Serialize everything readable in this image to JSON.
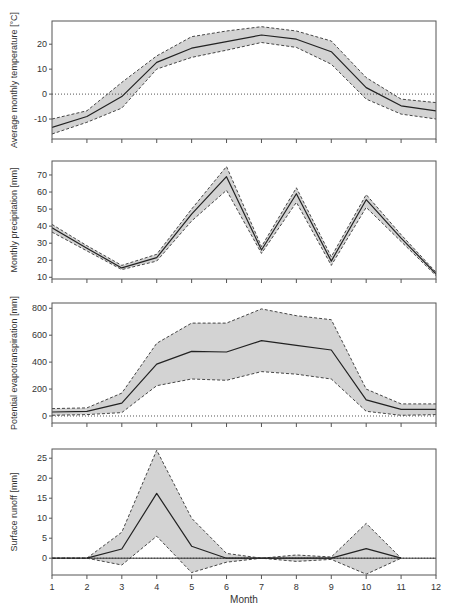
{
  "figure": {
    "x_axis_title": "Month",
    "x_tick_labels": [
      "1",
      "2",
      "3",
      "4",
      "5",
      "6",
      "7",
      "8",
      "9",
      "10",
      "11",
      "12"
    ]
  },
  "colors": {
    "band_fill": "#d3d3d3",
    "mean_line": "#222222",
    "bound_line": "#333333",
    "axis": "#555555",
    "zero_line": "#555555"
  },
  "chart_data": [
    {
      "type": "line",
      "title": "",
      "xlabel": "",
      "ylabel": "Average monthly temperature [°C]",
      "x": [
        1,
        2,
        3,
        4,
        5,
        6,
        7,
        8,
        9,
        10,
        11,
        12
      ],
      "ylim": [
        -18,
        29.3
      ],
      "yticks": [
        -10,
        0,
        10,
        20
      ],
      "ytick_labels": [
        "-10",
        "0",
        "10",
        "20"
      ],
      "zero_line": "dotted",
      "grid": false,
      "series": [
        {
          "name": "mean",
          "style": "solid",
          "values": [
            -13.4,
            -9,
            -1,
            12.7,
            18.4,
            21,
            23.7,
            22,
            17,
            2.6,
            -4.7,
            -6.7
          ]
        },
        {
          "name": "upper bound",
          "style": "dashed",
          "values": [
            -10,
            -6.7,
            4.7,
            15.3,
            23,
            25.3,
            27,
            25.3,
            21.3,
            6.6,
            -2,
            -3.4
          ]
        },
        {
          "name": "lower bound",
          "style": "dashed",
          "values": [
            -16,
            -11.3,
            -5.6,
            10,
            14.7,
            17.6,
            20.7,
            18.7,
            12,
            -2,
            -8,
            -10
          ]
        }
      ]
    },
    {
      "type": "line",
      "title": "",
      "xlabel": "",
      "ylabel": "Monthly precipitation [mm]",
      "x": [
        1,
        2,
        3,
        4,
        5,
        6,
        7,
        8,
        9,
        10,
        11,
        12
      ],
      "ylim": [
        9,
        78.2
      ],
      "yticks": [
        10,
        20,
        30,
        40,
        50,
        60,
        70
      ],
      "ytick_labels": [
        "10",
        "20",
        "30",
        "40",
        "50",
        "60",
        "70"
      ],
      "zero_line": "none",
      "grid": false,
      "series": [
        {
          "name": "mean",
          "style": "solid",
          "values": [
            39,
            27,
            15.5,
            21.5,
            47,
            69,
            26,
            59,
            19.5,
            55.5,
            33,
            12
          ]
        },
        {
          "name": "upper bound",
          "style": "dashed",
          "values": [
            41,
            28.5,
            17,
            23.5,
            50,
            75,
            28,
            62.5,
            22,
            58.5,
            35,
            13
          ]
        },
        {
          "name": "lower bound",
          "style": "dashed",
          "values": [
            36.5,
            25.5,
            14.5,
            19.5,
            43,
            61,
            24,
            54,
            17,
            51,
            31,
            11
          ]
        }
      ]
    },
    {
      "type": "line",
      "title": "",
      "xlabel": "",
      "ylabel": "Potential evapotranspiration [mm]",
      "x": [
        1,
        2,
        3,
        4,
        5,
        6,
        7,
        8,
        9,
        10,
        11,
        12
      ],
      "ylim": [
        -52,
        839
      ],
      "yticks": [
        0,
        200,
        400,
        600,
        800
      ],
      "ytick_labels": [
        "0",
        "200",
        "400",
        "600",
        "800"
      ],
      "zero_line": "dotted",
      "grid": false,
      "series": [
        {
          "name": "mean",
          "style": "solid",
          "values": [
            30,
            35,
            95,
            385,
            480,
            475,
            560,
            525,
            490,
            120,
            50,
            50
          ]
        },
        {
          "name": "upper bound",
          "style": "dashed",
          "values": [
            55,
            60,
            170,
            540,
            690,
            690,
            795,
            745,
            715,
            200,
            90,
            90
          ]
        },
        {
          "name": "lower bound",
          "style": "dashed",
          "values": [
            5,
            10,
            25,
            225,
            275,
            265,
            330,
            310,
            275,
            35,
            5,
            10
          ]
        }
      ]
    },
    {
      "type": "line",
      "title": "",
      "xlabel": "Month",
      "ylabel": "Surface runoff [mm]",
      "x": [
        1,
        2,
        3,
        4,
        5,
        6,
        7,
        8,
        9,
        10,
        11,
        12
      ],
      "ylim": [
        -4.2,
        27.3
      ],
      "yticks": [
        0,
        5,
        10,
        15,
        20,
        25
      ],
      "ytick_labels": [
        "0",
        "5",
        "10",
        "15",
        "20",
        "25"
      ],
      "zero_line": "dotted+solid",
      "grid": false,
      "series": [
        {
          "name": "mean",
          "style": "solid",
          "values": [
            0,
            0,
            2.3,
            16.2,
            3,
            0,
            0,
            0,
            0,
            2.4,
            0,
            null
          ]
        },
        {
          "name": "upper bound",
          "style": "dashed",
          "values": [
            0,
            0,
            6.5,
            27,
            10,
            1.2,
            0,
            0.8,
            0.3,
            8.7,
            0,
            null
          ]
        },
        {
          "name": "lower bound",
          "style": "dashed",
          "values": [
            0,
            0,
            -1.7,
            5.5,
            -3.6,
            -1,
            0,
            -0.8,
            -0.3,
            -4,
            0,
            null
          ]
        }
      ]
    }
  ]
}
